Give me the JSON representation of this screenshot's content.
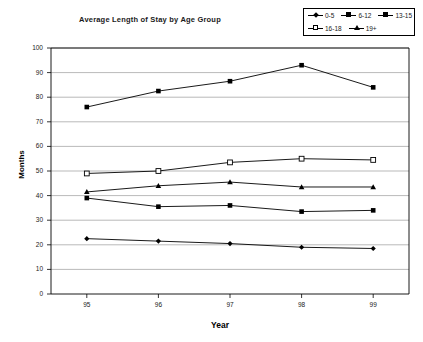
{
  "corner_fragment": "",
  "chart_data": {
    "type": "line",
    "title": "Average Length of Stay by Age Group",
    "xlabel": "Year",
    "ylabel": "Months",
    "categories": [
      "95",
      "96",
      "97",
      "98",
      "99"
    ],
    "ylim": [
      0,
      100
    ],
    "ytick_step": 10,
    "yticks": [
      "0",
      "10",
      "20",
      "30",
      "40",
      "50",
      "60",
      "70",
      "80",
      "90",
      "100"
    ],
    "grid": true,
    "legend_position": "top-right",
    "series": [
      {
        "name": "0-5",
        "marker": "diamond",
        "values": [
          22.5,
          21.5,
          20.5,
          19.0,
          18.5
        ]
      },
      {
        "name": "6-12",
        "marker": "square-filled",
        "values": [
          39.0,
          35.5,
          36.0,
          33.5,
          34.0
        ]
      },
      {
        "name": "13-15",
        "marker": "square-filled",
        "values": [
          76.0,
          82.5,
          86.5,
          93.0,
          84.0
        ]
      },
      {
        "name": "16-18",
        "marker": "square-open",
        "values": [
          49.0,
          50.0,
          53.5,
          55.0,
          54.5
        ]
      },
      {
        "name": "19+",
        "marker": "triangle",
        "values": [
          41.5,
          44.0,
          45.5,
          43.5,
          43.5
        ]
      }
    ]
  }
}
